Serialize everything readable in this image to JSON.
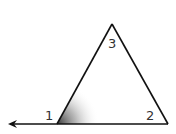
{
  "diagram": {
    "type": "triangle-exterior-angle",
    "labels": {
      "angle_1": "1",
      "angle_2": "2",
      "angle_3": "3"
    },
    "colors": {
      "stroke": "#111111",
      "label": "#333333",
      "shade_dark": "#333333",
      "shade_light": "#ffffff"
    },
    "vertices": {
      "apex": [
        112,
        24
      ],
      "bottom_left": [
        57,
        124
      ],
      "bottom_right": [
        168,
        124
      ]
    },
    "extension_arrow_tip": [
      8,
      124
    ]
  }
}
